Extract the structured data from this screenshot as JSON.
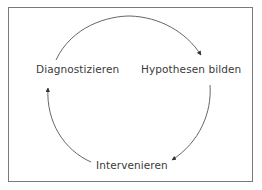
{
  "diagram": {
    "type": "cycle",
    "nodes": [
      {
        "id": "diagnostizieren",
        "label": "Diagnostizieren"
      },
      {
        "id": "hypothesen",
        "label": "Hypothesen bilden"
      },
      {
        "id": "intervenieren",
        "label": "Intervenieren"
      }
    ],
    "edges": [
      {
        "from": "diagnostizieren",
        "to": "hypothesen",
        "direction": "clockwise"
      },
      {
        "from": "hypothesen",
        "to": "intervenieren",
        "direction": "clockwise"
      },
      {
        "from": "intervenieren",
        "to": "diagnostizieren",
        "direction": "clockwise"
      }
    ],
    "colors": {
      "line": "#555555",
      "text": "#3a3a3a",
      "border": "#7a7a7a",
      "background": "#ffffff"
    }
  }
}
